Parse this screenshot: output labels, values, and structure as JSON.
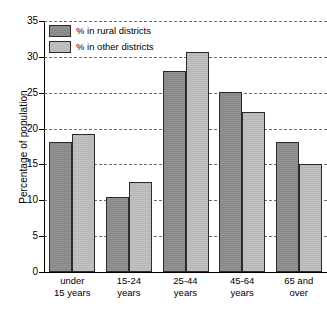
{
  "chart_data": {
    "type": "bar",
    "title": "",
    "subtitle": "",
    "xlabel": "",
    "ylabel": "Percentage of population",
    "ylim": [
      0,
      35
    ],
    "ytick_step": 5,
    "yticks": [
      0,
      5,
      10,
      15,
      20,
      25,
      30,
      35
    ],
    "ytick_labels": [
      "0",
      "5",
      "10",
      "15",
      "20",
      "25",
      "30",
      "35"
    ],
    "grid": true,
    "grid_style": "dashed-horizontal",
    "legend_position": "top-left",
    "categories": [
      "under 15 years",
      "15-24 years",
      "25-44 years",
      "45-64 years",
      "65 and over"
    ],
    "category_lines": [
      [
        "under",
        "15 years"
      ],
      [
        "15-24",
        "years"
      ],
      [
        "25-44",
        "years"
      ],
      [
        "45-64",
        "years"
      ],
      [
        "65 and",
        "over"
      ]
    ],
    "series": [
      {
        "name": "% in rural districts",
        "color": "#8d8d8d",
        "values": [
          18.1,
          10.5,
          28.0,
          25.1,
          18.1
        ]
      },
      {
        "name": "% in other districts",
        "color": "#bdbdbd",
        "values": [
          19.3,
          12.5,
          30.7,
          22.3,
          15.0
        ]
      }
    ]
  },
  "legend": {
    "items": [
      {
        "label": "% in rural districts",
        "swatch": "rural"
      },
      {
        "label": "% in other districts",
        "swatch": "other"
      }
    ]
  },
  "axis": {
    "y_title": "Percentage of population"
  }
}
